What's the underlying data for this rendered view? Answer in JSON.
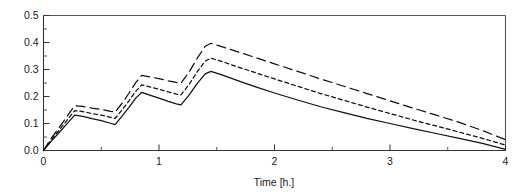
{
  "figure": {
    "cropped_title_ghost": "",
    "background_color": "#ffffff",
    "ink_color": "#111111"
  },
  "chart_data": {
    "type": "line",
    "title": "",
    "xlabel": "Time [h.]",
    "ylabel": "",
    "xlim": [
      0,
      4
    ],
    "ylim": [
      0,
      0.5
    ],
    "grid": false,
    "legend": "none",
    "x_ticks": [
      0,
      1,
      2,
      3,
      4
    ],
    "x_tick_labels": [
      "0",
      "1",
      "2",
      "3",
      "4"
    ],
    "x_minor_ticks": [
      0.5,
      1.5,
      2.5,
      3.5
    ],
    "y_ticks": [
      0.0,
      0.1,
      0.2,
      0.3,
      0.4,
      0.5
    ],
    "y_tick_labels": [
      "0.0",
      "0.1",
      "0.2",
      "0.3",
      "0.4",
      "0.5"
    ],
    "y_minor_ticks": [
      0.05,
      0.15,
      0.25,
      0.35,
      0.45
    ],
    "annotations": [],
    "series": [
      {
        "name": "lower-profile",
        "style": "solid",
        "dash": "none",
        "color": "#111111",
        "x": [
          0,
          0.06,
          0.13,
          0.2,
          0.27,
          0.34,
          0.42,
          0.5,
          0.58,
          0.62,
          0.68,
          0.74,
          0.8,
          0.85,
          0.92,
          1.0,
          1.08,
          1.15,
          1.19,
          1.26,
          1.33,
          1.4,
          1.45,
          1.55,
          1.7,
          1.85,
          2.0,
          2.2,
          2.4,
          2.6,
          2.8,
          3.0,
          3.2,
          3.4,
          3.6,
          3.8,
          4.0
        ],
        "y": [
          0.0,
          0.031,
          0.064,
          0.098,
          0.131,
          0.126,
          0.118,
          0.111,
          0.101,
          0.096,
          0.127,
          0.16,
          0.195,
          0.215,
          0.205,
          0.194,
          0.182,
          0.173,
          0.169,
          0.205,
          0.248,
          0.284,
          0.293,
          0.279,
          0.256,
          0.234,
          0.213,
          0.187,
          0.162,
          0.14,
          0.119,
          0.1,
          0.081,
          0.063,
          0.045,
          0.026,
          0.004
        ]
      },
      {
        "name": "middle-profile",
        "style": "short-dashed",
        "dash": "4 3",
        "color": "#111111",
        "x": [
          0,
          0.06,
          0.13,
          0.2,
          0.27,
          0.34,
          0.42,
          0.5,
          0.58,
          0.62,
          0.68,
          0.74,
          0.8,
          0.85,
          0.92,
          1.0,
          1.08,
          1.15,
          1.19,
          1.26,
          1.33,
          1.4,
          1.45,
          1.55,
          1.7,
          1.85,
          2.0,
          2.2,
          2.4,
          2.6,
          2.8,
          3.0,
          3.2,
          3.4,
          3.6,
          3.8,
          4.0
        ],
        "y": [
          0.0,
          0.036,
          0.073,
          0.11,
          0.148,
          0.144,
          0.137,
          0.131,
          0.123,
          0.119,
          0.15,
          0.184,
          0.22,
          0.243,
          0.236,
          0.227,
          0.217,
          0.209,
          0.206,
          0.244,
          0.291,
          0.331,
          0.342,
          0.329,
          0.307,
          0.286,
          0.265,
          0.238,
          0.211,
          0.186,
          0.161,
          0.137,
          0.113,
          0.091,
          0.068,
          0.045,
          0.02
        ]
      },
      {
        "name": "upper-profile",
        "style": "long-dashed",
        "dash": "9 5",
        "color": "#111111",
        "x": [
          0,
          0.06,
          0.13,
          0.2,
          0.27,
          0.34,
          0.42,
          0.5,
          0.58,
          0.62,
          0.68,
          0.74,
          0.8,
          0.85,
          0.92,
          1.0,
          1.08,
          1.15,
          1.19,
          1.26,
          1.33,
          1.4,
          1.45,
          1.55,
          1.7,
          1.85,
          2.0,
          2.2,
          2.4,
          2.6,
          2.8,
          3.0,
          3.2,
          3.4,
          3.6,
          3.8,
          4.0
        ],
        "y": [
          0.0,
          0.041,
          0.082,
          0.124,
          0.166,
          0.163,
          0.157,
          0.152,
          0.145,
          0.142,
          0.175,
          0.212,
          0.252,
          0.278,
          0.273,
          0.266,
          0.258,
          0.252,
          0.249,
          0.29,
          0.341,
          0.386,
          0.397,
          0.384,
          0.363,
          0.342,
          0.321,
          0.293,
          0.265,
          0.238,
          0.211,
          0.184,
          0.157,
          0.131,
          0.104,
          0.074,
          0.04
        ]
      }
    ]
  }
}
